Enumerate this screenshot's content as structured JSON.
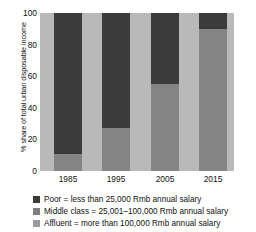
{
  "chart_data": {
    "type": "bar",
    "subtype": "stacked-percentage",
    "title": "",
    "xlabel": "",
    "ylabel": "% share of total urban disposable income",
    "ylim": [
      0,
      100
    ],
    "yticks": [
      "0",
      "20",
      "40",
      "60",
      "80",
      "100"
    ],
    "grid": false,
    "legend_position": "below",
    "categories": [
      "1985",
      "1995",
      "2005",
      "2015"
    ],
    "series": [
      {
        "name": "Poor = less than 25,000 Rmb annual salary",
        "color": "#3b3b3b",
        "values": [
          89,
          73,
          45,
          10
        ]
      },
      {
        "name": "Middle class = 25,001–100,000 Rmb annual salary",
        "color": "#7e7e7e",
        "values": [
          11,
          27,
          55,
          90
        ]
      },
      {
        "name": "Affluent = more than 100,000 Rmb annual salary",
        "color": "#9b9b9b",
        "values": [
          0,
          0,
          0,
          0
        ]
      }
    ]
  },
  "axes": {
    "y_title": "% share of total urban disposable income",
    "y_ticks": [
      {
        "label": "100",
        "value": 100
      },
      {
        "label": "80",
        "value": 80
      },
      {
        "label": "60",
        "value": 60
      },
      {
        "label": "40",
        "value": 40
      },
      {
        "label": "20",
        "value": 20
      },
      {
        "label": "0",
        "value": 0
      }
    ],
    "x_ticks": [
      {
        "label": "1985"
      },
      {
        "label": "1995"
      },
      {
        "label": "2005"
      },
      {
        "label": "2015"
      }
    ]
  },
  "legend": {
    "items": [
      {
        "swatch_name": "legend-swatch-poor",
        "label": "Poor = less than 25,000 Rmb annual salary"
      },
      {
        "swatch_name": "legend-swatch-middle",
        "label": "Middle class = 25,001–100,000 Rmb annual salary"
      },
      {
        "swatch_name": "legend-swatch-affluent",
        "label": "Affluent = more than 100,000 Rmb annual salary"
      }
    ]
  },
  "colors": {
    "poor": "#3b3b3b",
    "middle": "#7e7e7e",
    "affluent": "#9b9b9b",
    "plot_background": "#b9b9b9"
  }
}
